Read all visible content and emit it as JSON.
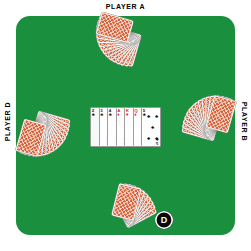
{
  "scene": {
    "title": "Poker Table Layout",
    "felt_color": "#1a8f3e",
    "background_color": "#ffffff",
    "card_back_color": "#d9643c"
  },
  "labels": {
    "player_a": "PLAYER A",
    "player_b": "PLAYER B",
    "player_d": "PLAYER D"
  },
  "dealer_button": {
    "label": "D",
    "color": "#000000",
    "text_color": "#ffffff"
  },
  "hands": [
    {
      "seat": "A",
      "position": "top",
      "card_count": 13,
      "face": "down"
    },
    {
      "seat": "B",
      "position": "right",
      "card_count": 13,
      "face": "down"
    },
    {
      "seat": "C",
      "position": "bottom",
      "card_count": 7,
      "face": "down"
    },
    {
      "seat": "D",
      "position": "left",
      "card_count": 13,
      "face": "down"
    }
  ],
  "community_cards": [
    {
      "rank": "2",
      "suit": "♣",
      "suit_name": "clubs",
      "color": "#111111",
      "covered": true
    },
    {
      "rank": "3",
      "suit": "♣",
      "suit_name": "clubs",
      "color": "#111111",
      "covered": true
    },
    {
      "rank": "4",
      "suit": "♣",
      "suit_name": "clubs",
      "color": "#111111",
      "covered": true
    },
    {
      "rank": "A",
      "suit": "♦",
      "suit_name": "diamonds",
      "color": "#d81d1d",
      "covered": true
    },
    {
      "rank": "K",
      "suit": "♥",
      "suit_name": "hearts",
      "color": "#d81d1d",
      "covered": true
    },
    {
      "rank": "Q",
      "suit": "♦",
      "suit_name": "diamonds",
      "color": "#d81d1d",
      "covered": true
    },
    {
      "rank": "5",
      "suit": "♣",
      "suit_name": "clubs",
      "color": "#111111",
      "covered": false
    }
  ]
}
